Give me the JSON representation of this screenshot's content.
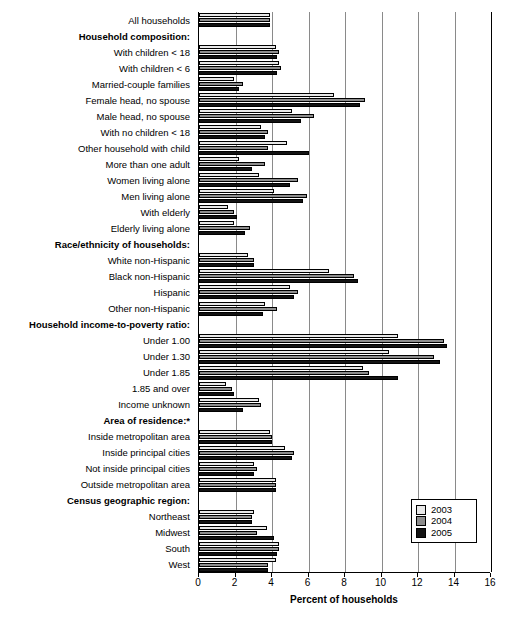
{
  "chart_data": {
    "type": "bar",
    "orientation": "horizontal",
    "title": "",
    "xlabel": "Percent of households",
    "ylabel": "",
    "xlim": [
      0,
      16
    ],
    "xticks": [
      0,
      2,
      4,
      6,
      8,
      10,
      12,
      14,
      16
    ],
    "grid": true,
    "legend_position": "bottom-right",
    "legend": [
      "2003",
      "2004",
      "2005"
    ],
    "series": [
      {
        "name": "2003",
        "color": "#e8e8e8"
      },
      {
        "name": "2004",
        "color": "#8d8d8d"
      },
      {
        "name": "2005",
        "color": "#131313"
      }
    ],
    "categories": [
      {
        "label": "All households",
        "type": "data",
        "values": [
          3.9,
          3.9,
          3.9
        ]
      },
      {
        "label": "Household composition:",
        "type": "header",
        "values": null
      },
      {
        "label": "With children < 18",
        "type": "data",
        "values": [
          4.2,
          4.4,
          4.3
        ]
      },
      {
        "label": "With children < 6",
        "type": "data",
        "values": [
          4.4,
          4.5,
          4.3
        ]
      },
      {
        "label": "Married-couple families",
        "type": "data",
        "values": [
          1.9,
          2.4,
          2.2
        ]
      },
      {
        "label": "Female head, no spouse",
        "type": "data",
        "values": [
          7.4,
          9.1,
          8.8
        ]
      },
      {
        "label": "Male head, no spouse",
        "type": "data",
        "values": [
          5.1,
          6.3,
          5.6
        ]
      },
      {
        "label": "With no children < 18",
        "type": "data",
        "values": [
          3.4,
          3.8,
          3.6
        ]
      },
      {
        "label": "Other household with child",
        "type": "data",
        "values": [
          4.8,
          3.8,
          6.0
        ]
      },
      {
        "label": "More than one adult",
        "type": "data",
        "values": [
          2.2,
          3.6,
          2.9
        ]
      },
      {
        "label": "Women living alone",
        "type": "data",
        "values": [
          3.3,
          5.4,
          5.0
        ]
      },
      {
        "label": "Men living alone",
        "type": "data",
        "values": [
          4.1,
          5.9,
          5.7
        ]
      },
      {
        "label": "With elderly",
        "type": "data",
        "values": [
          1.6,
          1.9,
          2.1
        ]
      },
      {
        "label": "Elderly living alone",
        "type": "data",
        "values": [
          1.9,
          2.8,
          2.5
        ]
      },
      {
        "label": "Race/ethnicity of households:",
        "type": "header",
        "values": null
      },
      {
        "label": "White non-Hispanic",
        "type": "data",
        "values": [
          2.7,
          3.0,
          3.0
        ]
      },
      {
        "label": "Black non-Hispanic",
        "type": "data",
        "values": [
          7.1,
          8.5,
          8.7
        ]
      },
      {
        "label": "Hispanic",
        "type": "data",
        "values": [
          5.0,
          5.4,
          5.2
        ]
      },
      {
        "label": "Other non-Hispanic",
        "type": "data",
        "values": [
          3.6,
          4.3,
          3.5
        ]
      },
      {
        "label": "Household income-to-poverty ratio:",
        "type": "header",
        "values": null
      },
      {
        "label": "Under 1.00",
        "type": "data",
        "values": [
          10.9,
          13.4,
          13.6
        ]
      },
      {
        "label": "Under 1.30",
        "type": "data",
        "values": [
          10.4,
          12.9,
          13.2
        ]
      },
      {
        "label": "Under 1.85",
        "type": "data",
        "values": [
          9.0,
          9.3,
          10.9
        ]
      },
      {
        "label": "1.85 and over",
        "type": "data",
        "values": [
          1.5,
          1.8,
          1.9
        ]
      },
      {
        "label": "Income unknown",
        "type": "data",
        "values": [
          3.3,
          3.4,
          2.4
        ]
      },
      {
        "label": "Area of residence:*",
        "type": "header",
        "values": null
      },
      {
        "label": "Inside metropolitan area",
        "type": "data",
        "values": [
          3.9,
          4.0,
          4.0
        ]
      },
      {
        "label": "Inside principal cities",
        "type": "data",
        "values": [
          4.7,
          5.2,
          5.1
        ]
      },
      {
        "label": "Not inside principal cities",
        "type": "data",
        "values": [
          3.0,
          3.2,
          3.0
        ]
      },
      {
        "label": "Outside metropolitan area",
        "type": "data",
        "values": [
          4.2,
          4.2,
          4.2
        ]
      },
      {
        "label": "Census geographic region:",
        "type": "header",
        "values": null
      },
      {
        "label": "Northeast",
        "type": "data",
        "values": [
          3.0,
          2.9,
          2.9
        ]
      },
      {
        "label": "Midwest",
        "type": "data",
        "values": [
          3.7,
          3.2,
          4.1
        ]
      },
      {
        "label": "South",
        "type": "data",
        "values": [
          4.4,
          4.4,
          4.3
        ]
      },
      {
        "label": "West",
        "type": "data",
        "values": [
          4.2,
          3.8,
          3.8
        ]
      }
    ]
  },
  "axis": {
    "x_title": "Percent of households",
    "tick_labels": [
      "0",
      "2",
      "4",
      "6",
      "8",
      "10",
      "12",
      "14",
      "16"
    ]
  },
  "legend": {
    "items": [
      {
        "label": "2003",
        "swatch": "y2003"
      },
      {
        "label": "2004",
        "swatch": "y2004"
      },
      {
        "label": "2005",
        "swatch": "y2005"
      }
    ]
  }
}
